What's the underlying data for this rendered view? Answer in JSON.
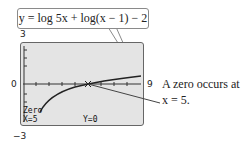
{
  "equation": "y = log 5x + log(x − 1) − 2",
  "window": {
    "ymax": "3",
    "ymin": "−3",
    "xmin": "0",
    "xmax": "9"
  },
  "calculator": {
    "mode_label": "Zero",
    "x_readout": "X=5",
    "y_readout": "Y=0"
  },
  "annotation": {
    "line1": "A zero occurs at",
    "line2": "x = 5."
  }
}
